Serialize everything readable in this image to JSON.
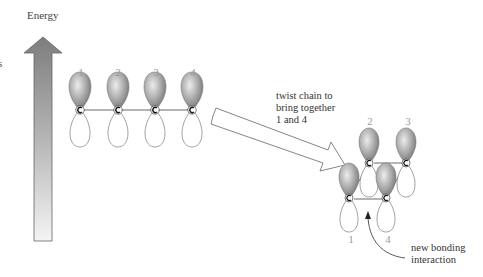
{
  "diagram": {
    "energy_axis": {
      "label": "Energy",
      "edge_text": "s"
    },
    "linear_chain": {
      "orbital_labels": [
        "1",
        "2",
        "3",
        "4"
      ],
      "atom_symbol": "C"
    },
    "transform_arrow": {
      "caption_lines": [
        "twist chain to",
        "bring together",
        "1 and 4"
      ]
    },
    "twisted_chain": {
      "orbital_labels": [
        "2",
        "3",
        "1",
        "4"
      ],
      "atom_symbol": "C"
    },
    "annotation": {
      "lines": [
        "new bonding",
        "interaction"
      ]
    },
    "colors": {
      "lobe_shaded": "#8a8a8a",
      "lobe_outline": "#777777",
      "arrow_fill_top": "#8c8c8c",
      "arrow_fill_bottom": "#f2f2f2",
      "bond": "#444444"
    }
  }
}
